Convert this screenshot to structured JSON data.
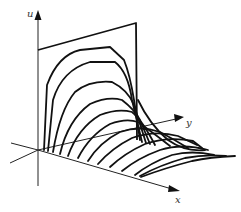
{
  "figure": {
    "type": "3d-surface-sketch",
    "axes": {
      "u": {
        "label": "u"
      },
      "x": {
        "label": "x"
      },
      "y": {
        "label": "y"
      }
    },
    "colors": {
      "line": "#111111",
      "background": "#ffffff"
    }
  }
}
